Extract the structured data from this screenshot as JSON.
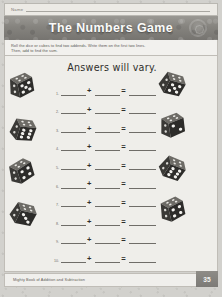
{
  "document": {
    "name_label": "Name",
    "title": "The Numbers Game",
    "instructions": [
      "Roll the dice or cubes to find two addends. Write them on the first two lines.",
      "Then, add to find the sum."
    ],
    "answers_note": "Answers will vary.",
    "plus_symbol": "+",
    "equals_symbol": "=",
    "rows": [
      {
        "number": "1."
      },
      {
        "number": "2."
      },
      {
        "number": "3."
      },
      {
        "number": "4."
      },
      {
        "number": "5."
      },
      {
        "number": "6."
      },
      {
        "number": "7."
      },
      {
        "number": "8."
      },
      {
        "number": "9."
      },
      {
        "number": "10."
      }
    ],
    "dice": [
      {
        "id": "die-left-1",
        "side": "left",
        "pips": 5,
        "rotation": -18
      },
      {
        "id": "die-left-2",
        "side": "left",
        "pips": 6,
        "rotation": 12
      },
      {
        "id": "die-left-3",
        "side": "left",
        "pips": 4,
        "rotation": -25
      },
      {
        "id": "die-left-4",
        "side": "left",
        "pips": 3,
        "rotation": 20
      },
      {
        "id": "die-right-1",
        "side": "right",
        "pips": 5,
        "rotation": 22
      },
      {
        "id": "die-right-2",
        "side": "right",
        "pips": 2,
        "rotation": -15
      },
      {
        "id": "die-right-3",
        "side": "right",
        "pips": 6,
        "rotation": 28
      },
      {
        "id": "die-right-4",
        "side": "right",
        "pips": 4,
        "rotation": -20
      }
    ],
    "footer_text": "Mighty Book of Addition and Subtraction",
    "page_number": "35",
    "colors": {
      "banner": "#85837e",
      "paper": "#efeeea",
      "page_tab": "#7c7a76",
      "die_face": "#3a3936",
      "die_pip": "#f2f1ee"
    }
  }
}
